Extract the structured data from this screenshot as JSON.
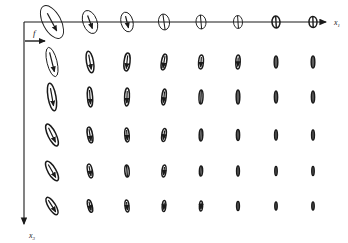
{
  "figure": {
    "background_color": "#ffffff",
    "ink_color": "#1a1a1a",
    "axes": {
      "horizontal": {
        "label": "x",
        "subscript": "1",
        "name": "x1-axis",
        "x_start": 24,
        "x_end": 330,
        "y": 22,
        "arrow": true
      },
      "vertical": {
        "label": "x",
        "subscript": "3",
        "name": "x3-axis",
        "y_start": 22,
        "y_end": 228,
        "x": 24,
        "arrow": true
      }
    },
    "force_annotation": {
      "label": "f",
      "name": "force-label",
      "arrow_x_start": 25,
      "arrow_x_end": 48,
      "arrow_y": 40,
      "label_x": 34,
      "label_y": 34
    },
    "grid": {
      "columns": 8,
      "rows": 6,
      "column_x": [
        52,
        90,
        127,
        164,
        201,
        238,
        276,
        313
      ],
      "row_y": [
        22,
        62,
        97,
        135,
        171,
        206
      ]
    },
    "ellipses": [
      {
        "row": 0,
        "col": 0,
        "cx": 52,
        "cy": 22,
        "rx": 9,
        "ry": 18,
        "angle": -28,
        "arrow": true,
        "arrow_len": 20
      },
      {
        "row": 0,
        "col": 1,
        "cx": 90,
        "cy": 22,
        "rx": 7,
        "ry": 12,
        "angle": -20,
        "arrow": true,
        "arrow_len": 14
      },
      {
        "row": 0,
        "col": 2,
        "cx": 127,
        "cy": 22,
        "rx": 6,
        "ry": 10,
        "angle": -14,
        "arrow": true,
        "arrow_len": 12
      },
      {
        "row": 0,
        "col": 3,
        "cx": 164,
        "cy": 22,
        "rx": 5.5,
        "ry": 8,
        "angle": -8,
        "arrow": false,
        "arrow_len": 0
      },
      {
        "row": 0,
        "col": 4,
        "cx": 201,
        "cy": 22,
        "rx": 5,
        "ry": 7,
        "angle": -5,
        "arrow": false,
        "arrow_len": 0
      },
      {
        "row": 0,
        "col": 5,
        "cx": 238,
        "cy": 22,
        "rx": 4.5,
        "ry": 6.5,
        "angle": -4,
        "arrow": false,
        "arrow_len": 0
      },
      {
        "row": 0,
        "col": 6,
        "cx": 276,
        "cy": 22,
        "rx": 4,
        "ry": 6,
        "angle": -3,
        "arrow": false,
        "arrow_len": 0
      },
      {
        "row": 0,
        "col": 7,
        "cx": 313,
        "cy": 22,
        "rx": 4,
        "ry": 5.5,
        "angle": -2,
        "arrow": false,
        "arrow_len": 0
      },
      {
        "row": 1,
        "col": 0,
        "cx": 52,
        "cy": 62,
        "rx": 5,
        "ry": 15,
        "angle": -14,
        "arrow": true,
        "arrow_len": 20
      },
      {
        "row": 1,
        "col": 1,
        "cx": 90,
        "cy": 62,
        "rx": 3.5,
        "ry": 11,
        "angle": -10,
        "arrow": true,
        "arrow_len": 15
      },
      {
        "row": 1,
        "col": 2,
        "cx": 127,
        "cy": 62,
        "rx": 3,
        "ry": 9,
        "angle": 6,
        "arrow": true,
        "arrow_len": 13
      },
      {
        "row": 1,
        "col": 3,
        "cx": 164,
        "cy": 62,
        "rx": 2.6,
        "ry": 8,
        "angle": 10,
        "arrow": true,
        "arrow_len": 12
      },
      {
        "row": 1,
        "col": 4,
        "cx": 201,
        "cy": 62,
        "rx": 2.4,
        "ry": 7,
        "angle": 4,
        "arrow": true,
        "arrow_len": 10
      },
      {
        "row": 1,
        "col": 5,
        "cx": 238,
        "cy": 62,
        "rx": 2.2,
        "ry": 7,
        "angle": 2,
        "arrow": true,
        "arrow_len": 9
      },
      {
        "row": 1,
        "col": 6,
        "cx": 276,
        "cy": 62,
        "rx": 1.8,
        "ry": 6,
        "angle": 0,
        "arrow": false,
        "arrow_len": 0
      },
      {
        "row": 1,
        "col": 7,
        "cx": 313,
        "cy": 62,
        "rx": 1.8,
        "ry": 6,
        "angle": 0,
        "arrow": false,
        "arrow_len": 0
      },
      {
        "row": 2,
        "col": 0,
        "cx": 52,
        "cy": 97,
        "rx": 4,
        "ry": 14,
        "angle": -10,
        "arrow": true,
        "arrow_len": 18
      },
      {
        "row": 2,
        "col": 1,
        "cx": 90,
        "cy": 97,
        "rx": 2.6,
        "ry": 10,
        "angle": -4,
        "arrow": true,
        "arrow_len": 14
      },
      {
        "row": 2,
        "col": 2,
        "cx": 127,
        "cy": 97,
        "rx": 2.4,
        "ry": 9,
        "angle": 2,
        "arrow": true,
        "arrow_len": 12
      },
      {
        "row": 2,
        "col": 3,
        "cx": 164,
        "cy": 97,
        "rx": 2.2,
        "ry": 8,
        "angle": 6,
        "arrow": true,
        "arrow_len": 11
      },
      {
        "row": 2,
        "col": 4,
        "cx": 201,
        "cy": 97,
        "rx": 2,
        "ry": 7,
        "angle": 2,
        "arrow": false,
        "arrow_len": 0
      },
      {
        "row": 2,
        "col": 5,
        "cx": 238,
        "cy": 97,
        "rx": 1.8,
        "ry": 7,
        "angle": 0,
        "arrow": false,
        "arrow_len": 0
      },
      {
        "row": 2,
        "col": 6,
        "cx": 276,
        "cy": 97,
        "rx": 1.6,
        "ry": 6,
        "angle": 0,
        "arrow": false,
        "arrow_len": 0
      },
      {
        "row": 2,
        "col": 7,
        "cx": 313,
        "cy": 97,
        "rx": 1.6,
        "ry": 6,
        "angle": 0,
        "arrow": false,
        "arrow_len": 0
      },
      {
        "row": 3,
        "col": 0,
        "cx": 52,
        "cy": 135,
        "rx": 4,
        "ry": 12,
        "angle": -26,
        "arrow": true,
        "arrow_len": 16
      },
      {
        "row": 3,
        "col": 1,
        "cx": 90,
        "cy": 135,
        "rx": 2.6,
        "ry": 8,
        "angle": -10,
        "arrow": true,
        "arrow_len": 12
      },
      {
        "row": 3,
        "col": 2,
        "cx": 127,
        "cy": 135,
        "rx": 2.2,
        "ry": 7,
        "angle": -4,
        "arrow": true,
        "arrow_len": 10
      },
      {
        "row": 3,
        "col": 3,
        "cx": 164,
        "cy": 135,
        "rx": 2.2,
        "ry": 6.5,
        "angle": 8,
        "arrow": true,
        "arrow_len": 9
      },
      {
        "row": 3,
        "col": 4,
        "cx": 201,
        "cy": 135,
        "rx": 1.8,
        "ry": 6,
        "angle": 2,
        "arrow": false,
        "arrow_len": 0
      },
      {
        "row": 3,
        "col": 5,
        "cx": 238,
        "cy": 135,
        "rx": 1.6,
        "ry": 5.5,
        "angle": 0,
        "arrow": false,
        "arrow_len": 0
      },
      {
        "row": 3,
        "col": 6,
        "cx": 276,
        "cy": 135,
        "rx": 1.4,
        "ry": 5,
        "angle": 0,
        "arrow": false,
        "arrow_len": 0
      },
      {
        "row": 3,
        "col": 7,
        "cx": 313,
        "cy": 135,
        "rx": 1.4,
        "ry": 5,
        "angle": 0,
        "arrow": false,
        "arrow_len": 0
      },
      {
        "row": 4,
        "col": 0,
        "cx": 52,
        "cy": 171,
        "rx": 4,
        "ry": 11,
        "angle": -30,
        "arrow": true,
        "arrow_len": 15
      },
      {
        "row": 4,
        "col": 1,
        "cx": 90,
        "cy": 171,
        "rx": 2.4,
        "ry": 7,
        "angle": -12,
        "arrow": true,
        "arrow_len": 10
      },
      {
        "row": 4,
        "col": 2,
        "cx": 127,
        "cy": 171,
        "rx": 2.2,
        "ry": 6,
        "angle": -4,
        "arrow": false,
        "arrow_len": 0
      },
      {
        "row": 4,
        "col": 3,
        "cx": 164,
        "cy": 171,
        "rx": 2,
        "ry": 6,
        "angle": 6,
        "arrow": true,
        "arrow_len": 8
      },
      {
        "row": 4,
        "col": 4,
        "cx": 201,
        "cy": 171,
        "rx": 1.6,
        "ry": 5,
        "angle": 2,
        "arrow": false,
        "arrow_len": 0
      },
      {
        "row": 4,
        "col": 5,
        "cx": 238,
        "cy": 171,
        "rx": 1.4,
        "ry": 5,
        "angle": 0,
        "arrow": false,
        "arrow_len": 0
      },
      {
        "row": 4,
        "col": 6,
        "cx": 276,
        "cy": 171,
        "rx": 1.2,
        "ry": 4.5,
        "angle": 0,
        "arrow": false,
        "arrow_len": 0
      },
      {
        "row": 4,
        "col": 7,
        "cx": 313,
        "cy": 171,
        "rx": 1.2,
        "ry": 4.5,
        "angle": 0,
        "arrow": false,
        "arrow_len": 0
      },
      {
        "row": 5,
        "col": 0,
        "cx": 52,
        "cy": 206,
        "rx": 3.6,
        "ry": 10,
        "angle": -32,
        "arrow": true,
        "arrow_len": 14
      },
      {
        "row": 5,
        "col": 1,
        "cx": 90,
        "cy": 206,
        "rx": 2.2,
        "ry": 6.5,
        "angle": -14,
        "arrow": true,
        "arrow_len": 9
      },
      {
        "row": 5,
        "col": 2,
        "cx": 127,
        "cy": 206,
        "rx": 2,
        "ry": 6,
        "angle": -6,
        "arrow": true,
        "arrow_len": 8
      },
      {
        "row": 5,
        "col": 3,
        "cx": 164,
        "cy": 206,
        "rx": 1.8,
        "ry": 5.5,
        "angle": 4,
        "arrow": true,
        "arrow_len": 7
      },
      {
        "row": 5,
        "col": 4,
        "cx": 201,
        "cy": 206,
        "rx": 1.6,
        "ry": 5,
        "angle": 2,
        "arrow": true,
        "arrow_len": 6
      },
      {
        "row": 5,
        "col": 5,
        "cx": 238,
        "cy": 206,
        "rx": 1.4,
        "ry": 4.5,
        "angle": 0,
        "arrow": false,
        "arrow_len": 0
      },
      {
        "row": 5,
        "col": 6,
        "cx": 276,
        "cy": 206,
        "rx": 1.2,
        "ry": 4,
        "angle": 0,
        "arrow": false,
        "arrow_len": 0
      },
      {
        "row": 5,
        "col": 7,
        "cx": 313,
        "cy": 206,
        "rx": 1.2,
        "ry": 4,
        "angle": 0,
        "arrow": false,
        "arrow_len": 0
      }
    ]
  },
  "chart_data": {
    "type": "scatter",
    "xlabel": "x1",
    "ylabel": "x3",
    "grid": false,
    "legend": null,
    "annotations": [
      "f"
    ],
    "columns": 8,
    "rows": 6,
    "size_by_column": [
      18,
      12,
      10,
      8,
      7,
      6.5,
      6,
      5.5
    ],
    "size_by_row": [
      18,
      15,
      14,
      12,
      11,
      10
    ],
    "tilt_top_row_deg": [
      -28,
      -20,
      -14,
      -8,
      -5,
      -4,
      -3,
      -2
    ]
  }
}
